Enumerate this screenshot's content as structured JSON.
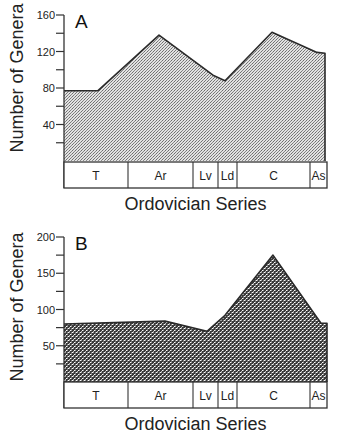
{
  "chart_data": [
    {
      "type": "area",
      "panel": "A",
      "title": "A",
      "xlabel": "Ordovician Series",
      "ylabel": "Number of Genera",
      "ylim": [
        0,
        160
      ],
      "yticks": [
        40,
        80,
        120,
        160
      ],
      "yminor_step": 20,
      "categories": [
        "T",
        "Ar",
        "Lv",
        "Ld",
        "C",
        "As"
      ],
      "category_bounds_px": [
        64,
        128,
        193,
        218,
        237,
        310,
        327
      ],
      "points": [
        {
          "x": 64,
          "y": 77
        },
        {
          "x": 98,
          "y": 77
        },
        {
          "x": 159,
          "y": 138
        },
        {
          "x": 213,
          "y": 94
        },
        {
          "x": 225,
          "y": 88
        },
        {
          "x": 272,
          "y": 141
        },
        {
          "x": 317,
          "y": 119
        },
        {
          "x": 325,
          "y": 118
        }
      ],
      "fill": "light-stipple",
      "grid": false
    },
    {
      "type": "area",
      "panel": "B",
      "title": "B",
      "xlabel": "Ordovician Series",
      "ylabel": "Number of Genera",
      "ylim": [
        0,
        200
      ],
      "yticks": [
        50,
        100,
        150,
        200
      ],
      "yminor_step": 25,
      "categories": [
        "T",
        "Ar",
        "Lv",
        "Ld",
        "C",
        "As"
      ],
      "category_bounds_px": [
        64,
        128,
        193,
        218,
        237,
        310,
        327
      ],
      "points": [
        {
          "x": 64,
          "y": 80
        },
        {
          "x": 165,
          "y": 84
        },
        {
          "x": 207,
          "y": 70
        },
        {
          "x": 225,
          "y": 92
        },
        {
          "x": 273,
          "y": 175
        },
        {
          "x": 321,
          "y": 81
        },
        {
          "x": 327,
          "y": 81
        }
      ],
      "fill": "dark-stipple",
      "grid": false
    }
  ],
  "colors": {
    "axis": "#333333",
    "outline": "#2a2a2a",
    "fill_a_bg": "#d6d6d6",
    "fill_a_dot": "#7a7a7a",
    "fill_b_bg": "#3c3c3c",
    "fill_b_dot": "#ffffff"
  }
}
